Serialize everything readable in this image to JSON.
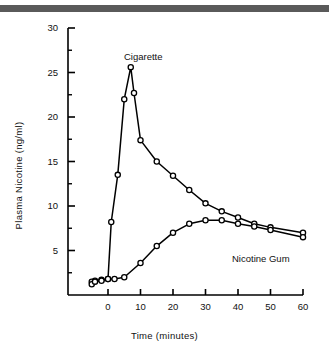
{
  "figure": {
    "top_band_color": "#5a5a5a",
    "background": "#ffffff",
    "line_color": "#000000",
    "marker_fill": "#ffffff"
  },
  "chart_data": {
    "type": "line",
    "title": "",
    "xlabel": "Time (minutes)",
    "ylabel": "Plasma Nicotine (ng/ml)",
    "xlim": [
      -5,
      60
    ],
    "ylim": [
      0,
      30
    ],
    "xticks": [
      0,
      10,
      20,
      30,
      40,
      50,
      60
    ],
    "xtick_labels": [
      "0",
      "10",
      "20",
      "30",
      "40",
      "50",
      "60"
    ],
    "yticks": [
      5,
      10,
      15,
      20,
      25,
      30
    ],
    "ytick_labels": [
      "5",
      "10",
      "15",
      "20",
      "25",
      "30"
    ],
    "y_minor_ticks": [
      2.5,
      7.5,
      12.5,
      17.5,
      22.5,
      27.5
    ],
    "grid": false,
    "legend": "inline-labels",
    "marker": "open-circle",
    "series": [
      {
        "name": "Cigarette",
        "label_position": "above-peak",
        "x": [
          -5,
          -4,
          -2,
          0,
          1,
          3,
          5,
          7,
          8,
          10,
          15,
          20,
          25,
          30,
          35,
          40,
          45,
          50,
          60
        ],
        "y": [
          1.5,
          1.6,
          1.7,
          1.8,
          8.2,
          13.5,
          22.0,
          25.6,
          22.7,
          17.4,
          15.0,
          13.4,
          11.8,
          10.3,
          9.4,
          8.7,
          8.0,
          7.6,
          7.0
        ]
      },
      {
        "name": "Nicotine Gum",
        "label_position": "below-right",
        "x": [
          -5,
          -4,
          -2,
          0,
          2,
          5,
          10,
          15,
          20,
          25,
          30,
          35,
          40,
          45,
          50,
          60
        ],
        "y": [
          1.2,
          1.5,
          1.6,
          1.8,
          1.8,
          2.0,
          3.6,
          5.5,
          7.0,
          8.0,
          8.4,
          8.4,
          8.0,
          7.7,
          7.3,
          6.5
        ]
      }
    ]
  }
}
